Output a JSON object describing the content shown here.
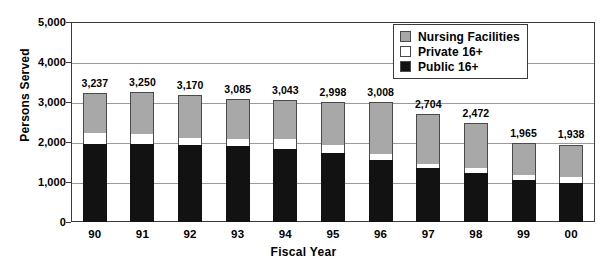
{
  "chart_data": {
    "type": "bar",
    "subtype": "stacked-vertical",
    "title": "",
    "xlabel": "Fiscal Year",
    "ylabel": "Persons Served",
    "categories": [
      "90",
      "91",
      "92",
      "93",
      "94",
      "95",
      "96",
      "97",
      "98",
      "99",
      "00"
    ],
    "ylim": [
      0,
      5000
    ],
    "ytick_values": [
      0,
      1000,
      2000,
      3000,
      4000,
      5000
    ],
    "ytick_labels": [
      "0",
      "1,000",
      "2,000",
      "3,000",
      "4,000",
      "5,000"
    ],
    "grid": true,
    "grid_axis": "y",
    "legend_position": "top-right",
    "series": [
      {
        "name": "Public 16+",
        "color": "#121212",
        "values": [
          1945,
          1940,
          1915,
          1890,
          1830,
          1715,
          1545,
          1355,
          1215,
          1045,
          985
        ]
      },
      {
        "name": "Private 16+",
        "color": "#ffffff",
        "values": [
          270,
          270,
          185,
          195,
          250,
          200,
          145,
          100,
          140,
          120,
          135
        ]
      },
      {
        "name": "Nursing Facilities",
        "color": "#a8a8a8",
        "values": [
          1022,
          1040,
          1070,
          1000,
          963,
          1083,
          1318,
          1249,
          1117,
          800,
          818
        ]
      }
    ],
    "totals": [
      3237,
      3250,
      3170,
      3085,
      3043,
      2998,
      3008,
      2704,
      2472,
      1965,
      1938
    ],
    "total_labels": [
      "3,237",
      "3,250",
      "3,170",
      "3,085",
      "3,043",
      "2,998",
      "3,008",
      "2,704",
      "2,472",
      "1,965",
      "1,938"
    ]
  },
  "legend": {
    "items": [
      {
        "label": "Nursing Facilities",
        "color": "#a8a8a8"
      },
      {
        "label": "Private 16+",
        "color": "#ffffff"
      },
      {
        "label": "Public 16+",
        "color": "#121212"
      }
    ]
  }
}
